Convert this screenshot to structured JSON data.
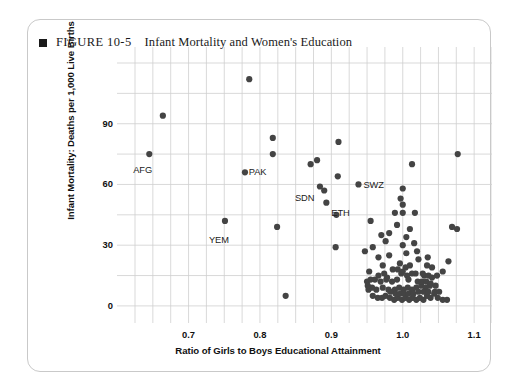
{
  "figure": {
    "bullet_icon": "filled-square-icon",
    "number": "FIGURE 10-5",
    "title": "Infant Mortality and Women's Education"
  },
  "chart_data": {
    "type": "scatter",
    "title": "Infant Mortality and Women's Education",
    "xlabel": "Ratio of Girls to Boys Educational Attainment",
    "ylabel": "Infant Mortality: Deaths per 1,000 Live Births",
    "xlim": [
      0.625,
      1.125
    ],
    "ylim": [
      -4,
      120
    ],
    "xticks": [
      0.7,
      0.8,
      0.9,
      1.0,
      1.1
    ],
    "xtick_labels": [
      "0.7",
      "0.8",
      "0.9",
      "1.0",
      "1.1"
    ],
    "yticks": [
      0,
      30,
      60,
      90
    ],
    "ytick_labels": [
      "0",
      "30",
      "60",
      "90"
    ],
    "grid": true,
    "grid_x_step": 0.025,
    "grid_y_step": 15,
    "legend": "none",
    "marker_color": "#444444",
    "marker_size": 3.1,
    "annotations": [
      {
        "label": "AFG",
        "x": 0.645,
        "y": 75,
        "dx": -16,
        "dy": 11
      },
      {
        "label": "PAK",
        "x": 0.818,
        "y": 75,
        "dx": -24,
        "dy": 13
      },
      {
        "label": "YEM",
        "x": 0.751,
        "y": 42,
        "dx": -16,
        "dy": 14
      },
      {
        "label": "SDN",
        "x": 0.884,
        "y": 59,
        "dx": -25,
        "dy": 7
      },
      {
        "label": "ETH",
        "x": 0.893,
        "y": 51,
        "dx": 5,
        "dy": 5
      },
      {
        "label": "SWZ",
        "x": 0.938,
        "y": 60,
        "dx": 5,
        "dy": -4
      }
    ],
    "points": [
      [
        0.785,
        112
      ],
      [
        0.664,
        94
      ],
      [
        0.645,
        75
      ],
      [
        0.818,
        83
      ],
      [
        0.818,
        75
      ],
      [
        0.779,
        66
      ],
      [
        0.871,
        70
      ],
      [
        0.88,
        72
      ],
      [
        0.91,
        81
      ],
      [
        0.909,
        64
      ],
      [
        0.89,
        57
      ],
      [
        0.884,
        59
      ],
      [
        0.893,
        51
      ],
      [
        0.938,
        60
      ],
      [
        0.907,
        45
      ],
      [
        0.751,
        42
      ],
      [
        0.824,
        39
      ],
      [
        0.836,
        5
      ],
      [
        1.077,
        75
      ],
      [
        1.013,
        70
      ],
      [
        1.0,
        58
      ],
      [
        0.997,
        53
      ],
      [
        1.0,
        50
      ],
      [
        1.0,
        46
      ],
      [
        0.989,
        46
      ],
      [
        1.017,
        46
      ],
      [
        0.955,
        42
      ],
      [
        0.992,
        40
      ],
      [
        0.981,
        36
      ],
      [
        1.005,
        34
      ],
      [
        1.01,
        38
      ],
      [
        1.069,
        39
      ],
      [
        1.076,
        38
      ],
      [
        0.906,
        29
      ],
      [
        0.947,
        27
      ],
      [
        0.958,
        29
      ],
      [
        0.981,
        25
      ],
      [
        1.005,
        26
      ],
      [
        1.02,
        27
      ],
      [
        0.953,
        17
      ],
      [
        0.972,
        20
      ],
      [
        0.996,
        21
      ],
      [
        1.004,
        19
      ],
      [
        1.01,
        20
      ],
      [
        1.022,
        23
      ],
      [
        1.035,
        24
      ],
      [
        1.056,
        17
      ],
      [
        1.064,
        22
      ],
      [
        1.048,
        15
      ],
      [
        1.03,
        15
      ],
      [
        1.036,
        15
      ],
      [
        1.041,
        14
      ],
      [
        1.028,
        16
      ],
      [
        1.018,
        16
      ],
      [
        1.013,
        16
      ],
      [
        1.006,
        15
      ],
      [
        0.998,
        16
      ],
      [
        0.992,
        13
      ],
      [
        0.985,
        12
      ],
      [
        0.977,
        13
      ],
      [
        0.972,
        9
      ],
      [
        0.963,
        8
      ],
      [
        0.957,
        9
      ],
      [
        0.952,
        8
      ],
      [
        0.958,
        5
      ],
      [
        0.965,
        4
      ],
      [
        0.971,
        4
      ],
      [
        0.976,
        5
      ],
      [
        0.982,
        4
      ],
      [
        0.988,
        3
      ],
      [
        0.993,
        4
      ],
      [
        0.999,
        3
      ],
      [
        1.004,
        4
      ],
      [
        1.009,
        3
      ],
      [
        1.014,
        4
      ],
      [
        1.019,
        3
      ],
      [
        1.024,
        4
      ],
      [
        1.029,
        3
      ],
      [
        1.034,
        5
      ],
      [
        1.039,
        4
      ],
      [
        1.044,
        6
      ],
      [
        1.049,
        4
      ],
      [
        1.056,
        3
      ],
      [
        1.062,
        3
      ],
      [
        0.969,
        12
      ],
      [
        0.98,
        8
      ],
      [
        0.989,
        8
      ],
      [
        0.995,
        9
      ],
      [
        1.001,
        8
      ],
      [
        1.007,
        9
      ],
      [
        1.013,
        8
      ],
      [
        1.019,
        9
      ],
      [
        1.026,
        10
      ],
      [
        1.032,
        9
      ],
      [
        1.038,
        10
      ],
      [
        0.966,
        15
      ],
      [
        0.961,
        13
      ],
      [
        0.986,
        18
      ],
      [
        0.993,
        18
      ],
      [
        1.0,
        17
      ],
      [
        1.008,
        13
      ],
      [
        1.021,
        12
      ],
      [
        1.027,
        12
      ],
      [
        1.033,
        12
      ],
      [
        1.039,
        11
      ],
      [
        1.046,
        10
      ],
      [
        1.045,
        7
      ],
      [
        1.051,
        7
      ],
      [
        0.974,
        16
      ],
      [
        0.978,
        14
      ],
      [
        0.983,
        7
      ],
      [
        0.99,
        6
      ],
      [
        0.996,
        6
      ],
      [
        1.002,
        6
      ],
      [
        1.008,
        6
      ],
      [
        1.015,
        6
      ],
      [
        1.022,
        7
      ],
      [
        1.029,
        7
      ],
      [
        1.036,
        7
      ],
      [
        0.95,
        12
      ],
      [
        0.951,
        10
      ],
      [
        0.955,
        13
      ],
      [
        1.041,
        19
      ],
      [
        1.034,
        20
      ],
      [
        0.966,
        24
      ],
      [
        0.976,
        32
      ],
      [
        0.97,
        35
      ],
      [
        1.0,
        30
      ],
      [
        1.016,
        31
      ]
    ]
  }
}
